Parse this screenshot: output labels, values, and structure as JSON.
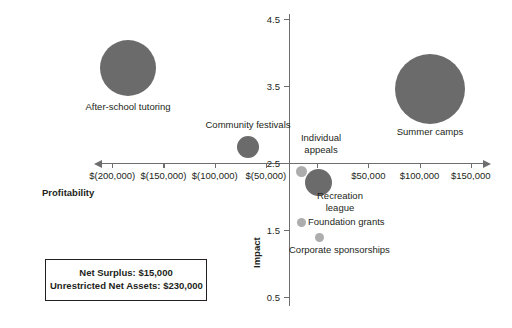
{
  "chart_data": {
    "type": "scatter",
    "title": "",
    "xlabel": "Profitability",
    "ylabel": "Impact",
    "xlim": [
      -200000,
      150000
    ],
    "ylim": [
      0.5,
      4.5
    ],
    "grid": false,
    "legend": "none",
    "x_tick_labels": [
      "$(200,000)",
      "$(150,000)",
      "$(100,000)",
      "$(50,000)",
      "$-",
      "$50,000",
      "$100,000",
      "$150,000"
    ],
    "x_tick_values": [
      -200000,
      -150000,
      -100000,
      -50000,
      0,
      50000,
      100000,
      150000
    ],
    "y_tick_labels": [
      "4.5",
      "3.5",
      "2.5",
      "1.5",
      "0.5"
    ],
    "y_tick_values": [
      4.5,
      3.5,
      2.5,
      1.5,
      0.5
    ],
    "points": [
      {
        "label": "After-school tutoring",
        "x": -153000,
        "y": 3.8,
        "size": 56,
        "px": 128,
        "py": 68,
        "r": 28,
        "label_px": 128,
        "label_py": 101,
        "size_class": "large"
      },
      {
        "label": "Community festivals",
        "x": -48000,
        "y": 2.72,
        "size": 22,
        "px": 248,
        "py": 147,
        "r": 11,
        "label_px": 248,
        "label_py": 119,
        "size_class": "medium"
      },
      {
        "label": "Summer camps",
        "x": 81000,
        "y": 3.47,
        "size": 70,
        "px": 430,
        "py": 89,
        "r": 35,
        "label_px": 430,
        "label_py": 126,
        "size_class": "large"
      },
      {
        "label": "Individual\nappeals",
        "x": 3000,
        "y": 2.38,
        "size": 11,
        "px": 301,
        "py": 171,
        "r": 5.5,
        "label_px": 321,
        "label_py": 132,
        "size_class": "small"
      },
      {
        "label": "Recreation\nleague",
        "x": 17000,
        "y": 2.22,
        "size": 27,
        "px": 318,
        "py": 182,
        "r": 13.5,
        "label_px": 355,
        "label_py": 190,
        "size_class": "medium"
      },
      {
        "label": "Foundation grants",
        "x": 2000,
        "y": 1.8,
        "size": 9,
        "px": 301,
        "py": 222,
        "r": 4.5,
        "label_px": 308,
        "label_py": 216,
        "size_class": "small"
      },
      {
        "label": "Corporate sponsorships",
        "x": 18000,
        "y": 1.57,
        "size": 9,
        "px": 319,
        "py": 237,
        "r": 4.5,
        "label_px": 289,
        "label_py": 244,
        "size_class": "small"
      }
    ]
  },
  "summary_box": {
    "lines": [
      "Net Surplus: $15,000",
      "Unrestricted Net Assets: $230,000"
    ]
  },
  "colors": {
    "bubble_large": "#6b6b6b",
    "bubble_small": "#adadad",
    "axis": "#6e6e6e",
    "text": "#231f20",
    "background": "#ffffff"
  }
}
